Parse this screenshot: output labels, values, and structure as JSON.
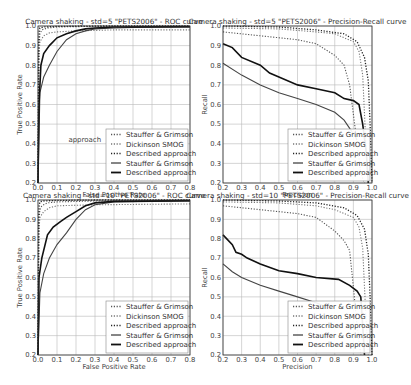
{
  "chart_data": [
    {
      "id": "roc_std5",
      "type": "line",
      "title": "Camera shaking - std=5 \"PETS2006\" - ROC curve",
      "xlabel": "False Positive Rate",
      "ylabel": "True Positive Rate",
      "xlim": [
        0.0,
        0.8
      ],
      "ylim": [
        0.2,
        1.0
      ],
      "xticks": [
        "0.0",
        "0.1",
        "0.2",
        "0.3",
        "0.4",
        "0.5",
        "0.6",
        "0.7",
        "0.8"
      ],
      "yticks": [
        "0.2",
        "0.3",
        "0.4",
        "0.5",
        "0.6",
        "0.7",
        "0.8",
        "0.9",
        "1.0"
      ],
      "grid": true,
      "legend_position": "lower right",
      "annotation": "approach",
      "series": [
        {
          "name": "Stauffer & Grimson",
          "style": "dotted",
          "x": [
            0.0,
            0.005,
            0.01,
            0.02,
            0.05,
            0.1,
            0.2,
            0.4,
            0.8
          ],
          "y": [
            0.2,
            0.9,
            0.96,
            0.98,
            0.99,
            0.995,
            0.997,
            0.998,
            0.998
          ]
        },
        {
          "name": "Dickinson SMOG",
          "style": "dotted",
          "x": [
            0.0,
            0.005,
            0.01,
            0.03,
            0.06,
            0.1,
            0.2,
            0.4,
            0.8
          ],
          "y": [
            0.2,
            0.85,
            0.92,
            0.95,
            0.965,
            0.97,
            0.975,
            0.98,
            0.98
          ]
        },
        {
          "name": "Described approach",
          "style": "dotted",
          "x": [
            0.0,
            0.003,
            0.006,
            0.01,
            0.03,
            0.1,
            0.3,
            0.8
          ],
          "y": [
            0.2,
            0.9,
            0.97,
            0.99,
            0.995,
            0.998,
            1.0,
            1.0
          ]
        },
        {
          "name": "Stauffer & Grimson",
          "style": "solid",
          "x": [
            0.0,
            0.01,
            0.03,
            0.06,
            0.1,
            0.15,
            0.2,
            0.25,
            0.3,
            0.4,
            0.5,
            0.8
          ],
          "y": [
            0.2,
            0.66,
            0.74,
            0.8,
            0.87,
            0.93,
            0.96,
            0.975,
            0.985,
            0.99,
            0.993,
            0.995
          ]
        },
        {
          "name": "Described approach",
          "style": "solid",
          "x": [
            0.0,
            0.005,
            0.015,
            0.03,
            0.06,
            0.1,
            0.15,
            0.2,
            0.25,
            0.3,
            0.4,
            0.8
          ],
          "y": [
            0.2,
            0.6,
            0.8,
            0.86,
            0.9,
            0.94,
            0.96,
            0.975,
            0.985,
            0.99,
            0.995,
            0.997
          ]
        }
      ]
    },
    {
      "id": "pr_std5",
      "type": "line",
      "title": "Camera shaking - std=5 \"PETS2006\" - Precision-Recall curve",
      "xlabel": "Precision",
      "ylabel": "Recall",
      "xlim": [
        0.2,
        1.0
      ],
      "ylim": [
        0.2,
        1.0
      ],
      "xticks": [
        "0.2",
        "0.3",
        "0.4",
        "0.5",
        "0.6",
        "0.7",
        "0.8",
        "0.9",
        "1.0"
      ],
      "yticks": [
        "0.2",
        "0.3",
        "0.4",
        "0.5",
        "0.6",
        "0.7",
        "0.8",
        "0.9",
        "1.0"
      ],
      "grid": true,
      "legend_position": "lower right",
      "series": [
        {
          "name": "Stauffer & Grimson",
          "style": "dotted",
          "x": [
            0.2,
            0.4,
            0.6,
            0.7,
            0.8,
            0.85,
            0.88,
            0.9,
            0.92,
            0.94,
            0.96
          ],
          "y": [
            0.97,
            0.95,
            0.93,
            0.91,
            0.85,
            0.8,
            0.7,
            0.55,
            0.4,
            0.25,
            0.2
          ]
        },
        {
          "name": "Dickinson SMOG",
          "style": "dotted",
          "x": [
            0.2,
            0.5,
            0.7,
            0.8,
            0.9,
            0.93,
            0.95,
            0.96,
            0.97,
            0.98
          ],
          "y": [
            0.99,
            0.985,
            0.97,
            0.96,
            0.92,
            0.87,
            0.75,
            0.55,
            0.35,
            0.2
          ]
        },
        {
          "name": "Described approach",
          "style": "dotted",
          "x": [
            0.2,
            0.5,
            0.7,
            0.85,
            0.92,
            0.96,
            0.98,
            0.99,
            1.0
          ],
          "y": [
            1.0,
            0.995,
            0.98,
            0.96,
            0.92,
            0.84,
            0.72,
            0.5,
            0.2
          ]
        },
        {
          "name": "Stauffer & Grimson",
          "style": "solid",
          "x": [
            0.2,
            0.3,
            0.4,
            0.5,
            0.6,
            0.7,
            0.8,
            0.85,
            0.9,
            0.92
          ],
          "y": [
            0.81,
            0.75,
            0.7,
            0.66,
            0.63,
            0.6,
            0.56,
            0.52,
            0.45,
            0.42
          ]
        },
        {
          "name": "Described approach",
          "style": "solid",
          "x": [
            0.2,
            0.25,
            0.3,
            0.4,
            0.45,
            0.5,
            0.6,
            0.7,
            0.8,
            0.85,
            0.9,
            0.93,
            0.95,
            0.97,
            0.98
          ],
          "y": [
            0.91,
            0.89,
            0.84,
            0.8,
            0.76,
            0.74,
            0.7,
            0.68,
            0.66,
            0.63,
            0.62,
            0.6,
            0.5,
            0.35,
            0.2
          ]
        }
      ]
    },
    {
      "id": "roc_std10",
      "type": "line",
      "title": "Camera shaking - std=10 \"PETS2006\" - ROC curve",
      "xlabel": "False Positive Rate",
      "ylabel": "True Positive Rate",
      "xlim": [
        0.0,
        0.8
      ],
      "ylim": [
        0.2,
        1.0
      ],
      "xticks": [
        "0.0",
        "0.1",
        "0.2",
        "0.3",
        "0.4",
        "0.5",
        "0.6",
        "0.7",
        "0.8"
      ],
      "yticks": [
        "0.2",
        "0.3",
        "0.4",
        "0.5",
        "0.6",
        "0.7",
        "0.8",
        "0.9",
        "1.0"
      ],
      "grid": true,
      "legend_position": "lower right",
      "series": [
        {
          "name": "Stauffer & Grimson",
          "style": "dotted",
          "x": [
            0.0,
            0.005,
            0.01,
            0.02,
            0.05,
            0.1,
            0.3,
            0.8
          ],
          "y": [
            0.2,
            0.9,
            0.95,
            0.97,
            0.985,
            0.99,
            0.995,
            0.997
          ]
        },
        {
          "name": "Dickinson SMOG",
          "style": "dotted",
          "x": [
            0.0,
            0.005,
            0.01,
            0.03,
            0.06,
            0.1,
            0.3,
            0.8
          ],
          "y": [
            0.2,
            0.85,
            0.91,
            0.94,
            0.96,
            0.97,
            0.975,
            0.98
          ]
        },
        {
          "name": "Described approach",
          "style": "dotted",
          "x": [
            0.0,
            0.003,
            0.006,
            0.01,
            0.03,
            0.1,
            0.3,
            0.8
          ],
          "y": [
            0.2,
            0.9,
            0.97,
            0.99,
            0.995,
            0.998,
            1.0,
            1.0
          ]
        },
        {
          "name": "Stauffer & Grimson",
          "style": "solid",
          "x": [
            0.0,
            0.01,
            0.03,
            0.06,
            0.1,
            0.15,
            0.2,
            0.25,
            0.3,
            0.4,
            0.8
          ],
          "y": [
            0.2,
            0.52,
            0.62,
            0.7,
            0.77,
            0.83,
            0.9,
            0.95,
            0.975,
            0.99,
            0.995
          ]
        },
        {
          "name": "Described approach",
          "style": "solid",
          "x": [
            0.0,
            0.005,
            0.02,
            0.05,
            0.08,
            0.12,
            0.15,
            0.2,
            0.25,
            0.3,
            0.4,
            0.8
          ],
          "y": [
            0.2,
            0.6,
            0.7,
            0.82,
            0.86,
            0.89,
            0.91,
            0.94,
            0.97,
            0.985,
            0.993,
            0.997
          ]
        }
      ]
    },
    {
      "id": "pr_std10",
      "type": "line",
      "title": "Camera shaking - std=10 \"PETS2006\" - Precision-Recall curve",
      "xlabel": "Precision",
      "ylabel": "Recall",
      "xlim": [
        0.2,
        1.0
      ],
      "ylim": [
        0.2,
        1.0
      ],
      "xticks": [
        "0.2",
        "0.3",
        "0.4",
        "0.5",
        "0.6",
        "0.7",
        "0.8",
        "0.9",
        "1.0"
      ],
      "yticks": [
        "0.2",
        "0.3",
        "0.4",
        "0.5",
        "0.6",
        "0.7",
        "0.8",
        "0.9",
        "1.0"
      ],
      "grid": true,
      "legend_position": "lower right",
      "series": [
        {
          "name": "Stauffer & Grimson",
          "style": "dotted",
          "x": [
            0.2,
            0.4,
            0.6,
            0.7,
            0.8,
            0.85,
            0.88,
            0.9,
            0.92,
            0.94
          ],
          "y": [
            0.97,
            0.95,
            0.93,
            0.91,
            0.84,
            0.79,
            0.74,
            0.55,
            0.35,
            0.2
          ]
        },
        {
          "name": "Dickinson SMOG",
          "style": "dotted",
          "x": [
            0.2,
            0.5,
            0.7,
            0.8,
            0.9,
            0.93,
            0.95,
            0.96,
            0.97,
            0.98
          ],
          "y": [
            0.99,
            0.985,
            0.97,
            0.95,
            0.91,
            0.86,
            0.75,
            0.55,
            0.35,
            0.2
          ]
        },
        {
          "name": "Described approach",
          "style": "dotted",
          "x": [
            0.2,
            0.5,
            0.7,
            0.85,
            0.92,
            0.96,
            0.98,
            0.99,
            1.0
          ],
          "y": [
            1.0,
            0.995,
            0.985,
            0.96,
            0.92,
            0.85,
            0.72,
            0.5,
            0.2
          ]
        },
        {
          "name": "Stauffer & Grimson",
          "style": "solid",
          "x": [
            0.2,
            0.25,
            0.3,
            0.4,
            0.5,
            0.6,
            0.7,
            0.75
          ],
          "y": [
            0.67,
            0.63,
            0.6,
            0.56,
            0.53,
            0.5,
            0.47,
            0.45
          ]
        },
        {
          "name": "Described approach",
          "style": "solid",
          "x": [
            0.2,
            0.25,
            0.27,
            0.3,
            0.33,
            0.4,
            0.5,
            0.6,
            0.7,
            0.82,
            0.88,
            0.92,
            0.94,
            0.95,
            0.96
          ],
          "y": [
            0.82,
            0.77,
            0.73,
            0.72,
            0.7,
            0.67,
            0.635,
            0.62,
            0.6,
            0.59,
            0.56,
            0.53,
            0.5,
            0.35,
            0.2
          ]
        }
      ]
    }
  ]
}
